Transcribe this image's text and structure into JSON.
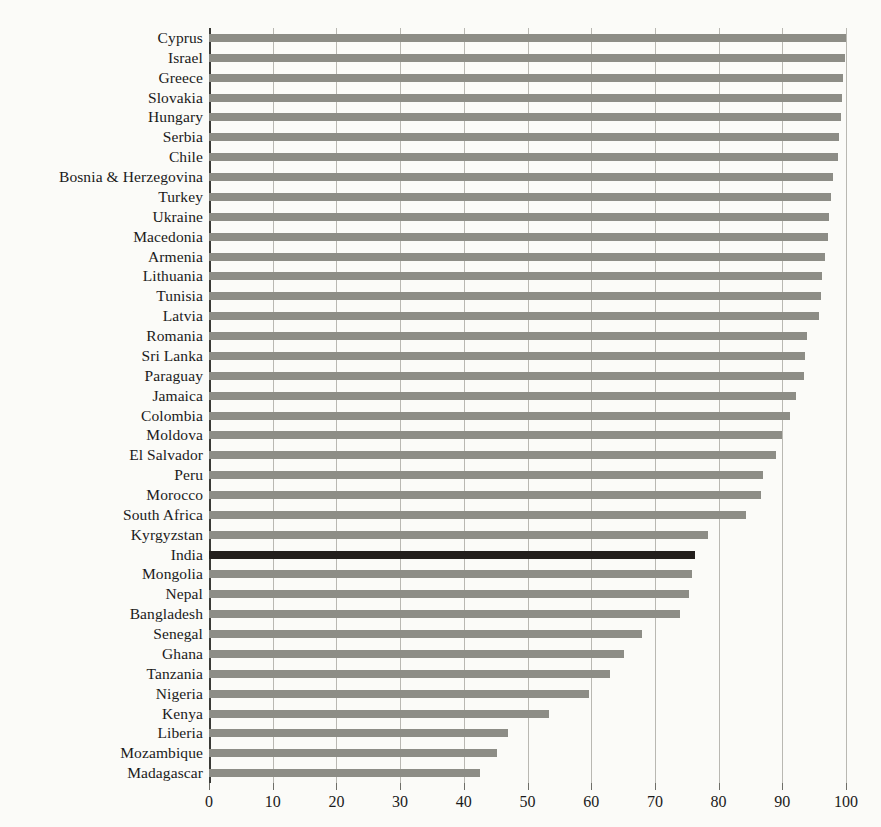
{
  "chart_data": {
    "type": "bar",
    "orientation": "horizontal",
    "title": "",
    "subtitle": "",
    "xlabel": "",
    "ylabel": "",
    "xlim": [
      0,
      100
    ],
    "ylim": null,
    "grid": true,
    "grid_axis": "x",
    "legend": false,
    "legend_position": "none",
    "xticks": [
      0,
      10,
      20,
      30,
      40,
      50,
      60,
      70,
      80,
      90,
      100
    ],
    "xtick_labels": [
      "0",
      "10",
      "20",
      "30",
      "40",
      "50",
      "60",
      "70",
      "80",
      "90",
      "100"
    ],
    "highlight_category": "India",
    "colors": {
      "bar": "#8d8d86",
      "highlight_bar": "#231f1c",
      "gridline": "#b9b8b2",
      "axis": "#3a3a36",
      "background": "#fbfbf8",
      "text": "#1a1a1a"
    },
    "categories": [
      "Cyprus",
      "Israel",
      "Greece",
      "Slovakia",
      "Hungary",
      "Serbia",
      "Chile",
      "Bosnia & Herzegovina",
      "Turkey",
      "Ukraine",
      "Macedonia",
      "Armenia",
      "Lithuania",
      "Tunisia",
      "Latvia",
      "Romania",
      "Sri Lanka",
      "Paraguay",
      "Jamaica",
      "Colombia",
      "Moldova",
      "El Salvador",
      "Peru",
      "Morocco",
      "South Africa",
      "Kyrgyzstan",
      "India",
      "Mongolia",
      "Nepal",
      "Bangladesh",
      "Senegal",
      "Ghana",
      "Tanzania",
      "Nigeria",
      "Kenya",
      "Liberia",
      "Mozambique",
      "Madagascar"
    ],
    "values": [
      100.0,
      99.8,
      99.6,
      99.4,
      99.2,
      98.9,
      98.7,
      98.0,
      97.6,
      97.4,
      97.1,
      96.7,
      96.3,
      96.1,
      95.8,
      93.8,
      93.6,
      93.4,
      92.2,
      91.2,
      90.0,
      89.0,
      86.9,
      86.6,
      84.3,
      78.3,
      76.3,
      75.8,
      75.3,
      74.0,
      68.0,
      65.2,
      63.0,
      59.6,
      53.4,
      47.0,
      45.2,
      42.5
    ]
  }
}
